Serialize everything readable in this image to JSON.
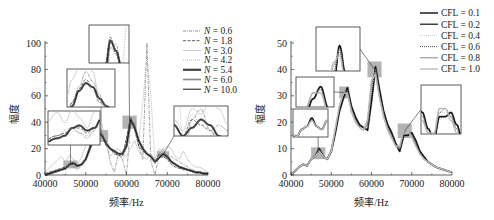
{
  "chart_data": [
    {
      "type": "line",
      "panel": "left",
      "title": "",
      "xlabel": "频率/Hz",
      "ylabel": "幅度",
      "xlim": [
        40000,
        80000
      ],
      "ylim": [
        0,
        100
      ],
      "xticks": [
        40000,
        50000,
        60000,
        70000,
        80000
      ],
      "yticks": [
        0,
        20,
        40,
        60,
        80,
        100
      ],
      "grid": false,
      "legend_position": "upper right",
      "px": {
        "x0": 45,
        "x1": 208,
        "y0": 175,
        "y1": 43
      },
      "x": [
        40000,
        42000,
        44000,
        45000,
        46000,
        47000,
        48000,
        49000,
        50000,
        51000,
        52000,
        53000,
        54000,
        55000,
        56000,
        57000,
        58000,
        59000,
        60000,
        61000,
        62000,
        63000,
        64000,
        65000,
        66000,
        67000,
        68000,
        69000,
        70000,
        71000,
        72000,
        73000,
        74000,
        75000,
        76000,
        77000,
        78000,
        79000,
        80000
      ],
      "series": [
        {
          "name": "N = 0.6",
          "style": "dot-dash",
          "color": "#777777",
          "width": 0.7,
          "values": [
            1,
            3,
            5,
            6,
            8,
            6,
            4,
            7,
            12,
            22,
            30,
            38,
            33,
            26,
            10,
            2,
            16,
            12,
            0,
            38,
            40,
            22,
            12,
            100,
            10,
            0,
            16,
            20,
            12,
            14,
            12,
            10,
            8,
            6,
            4,
            3,
            2,
            2,
            1
          ]
        },
        {
          "name": "N = 1.8",
          "style": "dashed",
          "color": "#333333",
          "width": 0.8,
          "values": [
            1,
            3,
            5,
            6,
            8,
            8,
            6,
            8,
            12,
            22,
            29,
            34,
            30,
            22,
            20,
            16,
            15,
            14,
            28,
            44,
            34,
            22,
            18,
            16,
            14,
            10,
            16,
            14,
            12,
            8,
            6,
            5,
            4,
            4,
            3,
            2,
            2,
            1,
            1
          ]
        },
        {
          "name": "N = 3.0",
          "style": "solid",
          "color": "#bbbbbb",
          "width": 0.7,
          "values": [
            2,
            8,
            14,
            10,
            15,
            12,
            8,
            14,
            22,
            34,
            40,
            42,
            38,
            24,
            14,
            18,
            20,
            16,
            14,
            20,
            26,
            18,
            14,
            12,
            16,
            12,
            20,
            18,
            22,
            20,
            14,
            12,
            18,
            12,
            8,
            6,
            6,
            4,
            2
          ]
        },
        {
          "name": "N = 4.2",
          "style": "dotted",
          "color": "#aaaaaa",
          "width": 0.8,
          "values": [
            1,
            3,
            5,
            7,
            8,
            6,
            5,
            8,
            12,
            22,
            28,
            33,
            28,
            22,
            20,
            16,
            14,
            12,
            20,
            38,
            34,
            26,
            55,
            90,
            60,
            8,
            18,
            14,
            12,
            10,
            8,
            6,
            5,
            4,
            3,
            2,
            2,
            1,
            1
          ]
        },
        {
          "name": "N = 5.4",
          "style": "solid",
          "color": "#444444",
          "width": 2.2,
          "values": [
            0,
            2,
            4,
            5,
            8,
            9,
            7,
            8,
            12,
            20,
            28,
            32,
            30,
            24,
            20,
            18,
            16,
            16,
            22,
            42,
            36,
            26,
            20,
            16,
            14,
            10,
            13,
            16,
            14,
            10,
            8,
            6,
            5,
            4,
            3,
            2,
            2,
            1,
            1
          ]
        },
        {
          "name": "N = 6.0",
          "style": "solid",
          "color": "#888888",
          "width": 1.6,
          "values": [
            0,
            2,
            4,
            5,
            8,
            9,
            7,
            8,
            12,
            20,
            28,
            32,
            30,
            24,
            20,
            18,
            16,
            16,
            22,
            42,
            36,
            26,
            20,
            16,
            14,
            10,
            13,
            16,
            14,
            10,
            8,
            6,
            5,
            4,
            3,
            2,
            2,
            1,
            1
          ]
        },
        {
          "name": "N = 10.0",
          "style": "solid",
          "color": "#111111",
          "width": 1.0,
          "values": [
            0,
            2,
            4,
            5,
            8,
            9,
            7,
            8,
            12,
            20,
            28,
            32,
            30,
            24,
            20,
            18,
            16,
            16,
            22,
            42,
            36,
            26,
            20,
            16,
            14,
            10,
            13,
            16,
            14,
            10,
            8,
            6,
            5,
            4,
            3,
            2,
            2,
            1,
            1
          ]
        }
      ],
      "highlight_boxes": [
        {
          "x": [
            44500,
            48000
          ],
          "y": [
            5,
            11
          ]
        },
        {
          "x": [
            52000,
            55500
          ],
          "y": [
            25,
            34
          ]
        },
        {
          "x": [
            59000,
            62500
          ],
          "y": [
            35,
            45
          ]
        },
        {
          "x": [
            67500,
            70500
          ],
          "y": [
            13,
            18
          ]
        }
      ],
      "insets": [
        {
          "px": [
            48,
            111,
            52,
            34
          ],
          "label": "inset-46000"
        },
        {
          "px": [
            67,
            69,
            48,
            38
          ],
          "label": "inset-53500"
        },
        {
          "px": [
            89,
            25,
            40,
            38
          ],
          "label": "inset-61000"
        },
        {
          "px": [
            174,
            106,
            54,
            30
          ],
          "label": "inset-69000"
        }
      ]
    },
    {
      "type": "line",
      "panel": "right",
      "title": "",
      "xlabel": "频率/Hz",
      "ylabel": "幅度",
      "xlim": [
        40000,
        80000
      ],
      "ylim": [
        0,
        50
      ],
      "xticks": [
        40000,
        50000,
        60000,
        70000,
        80000
      ],
      "yticks": [
        0,
        10,
        20,
        30,
        40,
        50
      ],
      "grid": false,
      "legend_position": "upper right",
      "px": {
        "x0": 291,
        "x1": 452,
        "y0": 175,
        "y1": 43
      },
      "x": [
        40000,
        42000,
        43000,
        44000,
        45000,
        46000,
        47000,
        48000,
        49000,
        50000,
        51000,
        52000,
        53000,
        54000,
        55000,
        56000,
        57000,
        58000,
        59000,
        60000,
        61000,
        62000,
        63000,
        64000,
        65000,
        66000,
        67000,
        68000,
        69000,
        70000,
        71000,
        72000,
        73000,
        74000,
        75000,
        76000,
        78000,
        80000
      ],
      "series": [
        {
          "name": "CFL = 0.1",
          "style": "solid",
          "color": "#555555",
          "width": 2.0,
          "values": [
            0,
            3,
            4,
            3.5,
            6,
            7,
            10,
            7,
            6,
            9,
            16,
            24,
            29,
            33,
            26,
            22,
            19,
            18,
            17,
            28,
            41,
            32,
            24,
            19,
            16,
            12,
            9,
            15,
            15,
            16,
            13,
            9,
            7,
            5,
            4,
            3,
            2,
            1
          ]
        },
        {
          "name": "CFL = 0.2",
          "style": "solid",
          "color": "#111111",
          "width": 1.2,
          "values": [
            0,
            3,
            4,
            3.5,
            6,
            7,
            10,
            7,
            6,
            9,
            16,
            24,
            29,
            33,
            26,
            22,
            19,
            18,
            17,
            28,
            41,
            32,
            24,
            19,
            16,
            12,
            9,
            15,
            15,
            16,
            13,
            9,
            7,
            5,
            4,
            3,
            2,
            1
          ]
        },
        {
          "name": "CFL = 0.4",
          "style": "dotted",
          "color": "#cccccc",
          "width": 1.0,
          "values": [
            0,
            3,
            4,
            3.5,
            6,
            7,
            9.5,
            7,
            6,
            9,
            17,
            25,
            31,
            32,
            25,
            21,
            18,
            17,
            18,
            32,
            40,
            30,
            23,
            18,
            15,
            11,
            10,
            16,
            16,
            15,
            12,
            8,
            6,
            5,
            4,
            3,
            2,
            1
          ]
        },
        {
          "name": "CFL = 0.6",
          "style": "dotted",
          "color": "#333333",
          "width": 0.9,
          "values": [
            0,
            3,
            4,
            3.5,
            6,
            7,
            9.5,
            7,
            6,
            9,
            17,
            25,
            31,
            32,
            25,
            21,
            18,
            17,
            19,
            33,
            40,
            30,
            23,
            18,
            15,
            11,
            10,
            16,
            17,
            15,
            12,
            8,
            6,
            5,
            4,
            3,
            2,
            1
          ]
        },
        {
          "name": "CFL = 0.8",
          "style": "solid",
          "color": "#888888",
          "width": 1.0,
          "values": [
            0,
            3,
            4,
            3.5,
            6,
            7,
            9,
            7,
            6,
            9,
            17,
            26,
            31,
            31,
            24,
            20,
            18,
            17,
            20,
            35,
            39,
            29,
            22,
            18,
            14,
            11,
            10,
            17,
            17,
            15,
            11,
            8,
            6,
            5,
            4,
            3,
            2,
            1
          ]
        },
        {
          "name": "CFL = 1.0",
          "style": "solid",
          "color": "#bbbbbb",
          "width": 1.4,
          "values": [
            0,
            3,
            4,
            3.5,
            6,
            7,
            9,
            7,
            6,
            9,
            18,
            26,
            31,
            31,
            24,
            20,
            18,
            17,
            21,
            36,
            38,
            29,
            22,
            17,
            14,
            11,
            11,
            17,
            17,
            14,
            11,
            8,
            6,
            5,
            4,
            3,
            2,
            1
          ]
        }
      ],
      "highlight_boxes": [
        {
          "x": [
            45000,
            48500
          ],
          "y": [
            6,
            10.5
          ]
        },
        {
          "x": [
            52000,
            54500
          ],
          "y": [
            29,
            33.5
          ]
        },
        {
          "x": [
            59000,
            62500
          ],
          "y": [
            37,
            43
          ]
        },
        {
          "x": [
            66500,
            70000
          ],
          "y": [
            14,
            19.5
          ]
        }
      ],
      "insets": [
        {
          "px": [
            293,
            109,
            35,
            28
          ],
          "label": "inset-46500"
        },
        {
          "px": [
            296,
            77,
            38,
            30
          ],
          "label": "inset-53000"
        },
        {
          "px": [
            316,
            27,
            44,
            44
          ],
          "label": "inset-61000"
        },
        {
          "px": [
            421,
            85,
            40,
            49
          ],
          "label": "inset-69000"
        }
      ]
    }
  ]
}
